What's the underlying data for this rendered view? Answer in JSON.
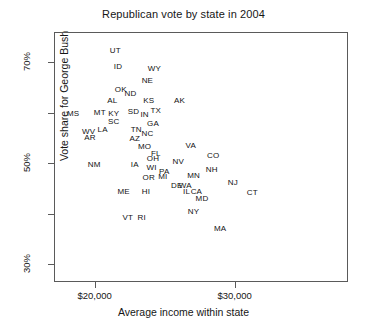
{
  "chart_data": {
    "type": "scatter",
    "title": "Republican vote by state in 2004",
    "xlabel": "Average income within state",
    "ylabel": "Vote share for George Bush",
    "grid": false,
    "legend": "none",
    "point_marker": "text-label",
    "xlim": [
      17100,
      38100
    ],
    "ylim": [
      26.5,
      76.0
    ],
    "xticks": [
      {
        "value": 20000,
        "label": "$20,000"
      },
      {
        "value": 30000,
        "label": "$30,000"
      }
    ],
    "yticks": [
      {
        "value": 30,
        "label": "30%"
      },
      {
        "value": 40,
        "label": ""
      },
      {
        "value": 50,
        "label": "50%"
      },
      {
        "value": 60,
        "label": ""
      },
      {
        "value": 70,
        "label": "70%"
      }
    ],
    "x_unit": "US dollars",
    "y_unit": "percent",
    "points": [
      {
        "label": "UT",
        "x": 21400,
        "y": 72.5
      },
      {
        "label": "ID",
        "x": 21600,
        "y": 69.2
      },
      {
        "label": "WY",
        "x": 24200,
        "y": 68.8
      },
      {
        "label": "NE",
        "x": 23700,
        "y": 66.5
      },
      {
        "label": "OK",
        "x": 21800,
        "y": 64.8
      },
      {
        "label": "ND",
        "x": 22500,
        "y": 63.9
      },
      {
        "label": "AL",
        "x": 21200,
        "y": 62.6
      },
      {
        "label": "KS",
        "x": 23800,
        "y": 62.5
      },
      {
        "label": "AK",
        "x": 26000,
        "y": 62.5
      },
      {
        "label": "MS",
        "x": 18400,
        "y": 60.0
      },
      {
        "label": "MT",
        "x": 20300,
        "y": 60.1
      },
      {
        "label": "KY",
        "x": 21300,
        "y": 60.0
      },
      {
        "label": "SD",
        "x": 22700,
        "y": 60.3
      },
      {
        "label": "IN",
        "x": 23500,
        "y": 59.8
      },
      {
        "label": "TX",
        "x": 24300,
        "y": 60.6
      },
      {
        "label": "SC",
        "x": 21300,
        "y": 58.3
      },
      {
        "label": "GA",
        "x": 24100,
        "y": 58.0
      },
      {
        "label": "WV",
        "x": 19500,
        "y": 56.4
      },
      {
        "label": "LA",
        "x": 20500,
        "y": 56.8
      },
      {
        "label": "TN",
        "x": 22900,
        "y": 56.7
      },
      {
        "label": "NC",
        "x": 23700,
        "y": 56.0
      },
      {
        "label": "AR",
        "x": 19600,
        "y": 55.2
      },
      {
        "label": "AZ",
        "x": 22800,
        "y": 55.0
      },
      {
        "label": "MO",
        "x": 23500,
        "y": 53.4
      },
      {
        "label": "VA",
        "x": 26800,
        "y": 53.7
      },
      {
        "label": "FL",
        "x": 24300,
        "y": 52.1
      },
      {
        "label": "CO",
        "x": 28400,
        "y": 51.7
      },
      {
        "label": "OH",
        "x": 24100,
        "y": 51.0
      },
      {
        "label": "NV",
        "x": 25900,
        "y": 50.5
      },
      {
        "label": "NM",
        "x": 19900,
        "y": 49.8
      },
      {
        "label": "IA",
        "x": 22800,
        "y": 49.9
      },
      {
        "label": "WI",
        "x": 24000,
        "y": 49.3
      },
      {
        "label": "PA",
        "x": 24900,
        "y": 48.5
      },
      {
        "label": "NH",
        "x": 28300,
        "y": 48.9
      },
      {
        "label": "MN",
        "x": 27000,
        "y": 47.6
      },
      {
        "label": "OR",
        "x": 23800,
        "y": 47.2
      },
      {
        "label": "MI",
        "x": 24800,
        "y": 47.4
      },
      {
        "label": "DE",
        "x": 25800,
        "y": 45.8
      },
      {
        "label": "WA",
        "x": 26400,
        "y": 45.8
      },
      {
        "label": "ME",
        "x": 22000,
        "y": 44.6
      },
      {
        "label": "HI",
        "x": 23600,
        "y": 44.6
      },
      {
        "label": "IL",
        "x": 26500,
        "y": 44.6
      },
      {
        "label": "CA",
        "x": 27200,
        "y": 44.6
      },
      {
        "label": "NJ",
        "x": 29800,
        "y": 46.3
      },
      {
        "label": "CT",
        "x": 31200,
        "y": 44.3
      },
      {
        "label": "MD",
        "x": 27600,
        "y": 43.1
      },
      {
        "label": "NY",
        "x": 27000,
        "y": 40.5
      },
      {
        "label": "VT",
        "x": 22300,
        "y": 39.4
      },
      {
        "label": "RI",
        "x": 23300,
        "y": 39.4
      },
      {
        "label": "MA",
        "x": 28900,
        "y": 37.2
      }
    ]
  }
}
